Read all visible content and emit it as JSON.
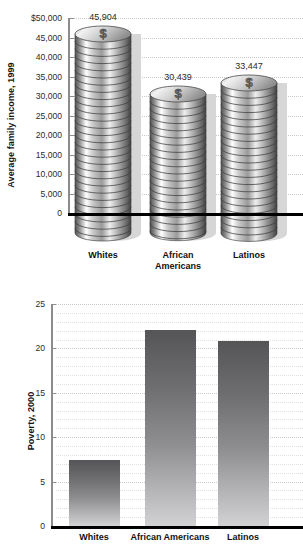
{
  "chart_data": [
    {
      "id": "income-chart",
      "type": "bar",
      "style": "pictorial-coin-stack",
      "title": "",
      "ylabel": "Average family income, 1999",
      "xlabel": "",
      "categories": [
        "Whites",
        "African Americans",
        "Latinos"
      ],
      "category_lines": [
        [
          "Whites"
        ],
        [
          "African",
          "Americans"
        ],
        [
          "Latinos"
        ]
      ],
      "values": [
        45904,
        30439,
        33447
      ],
      "value_labels": [
        "45,904",
        "30,439",
        "33,447"
      ],
      "ylim": [
        0,
        50000
      ],
      "ytick_values": [
        50000,
        45000,
        40000,
        35000,
        30000,
        25000,
        20000,
        15000,
        10000,
        5000,
        0
      ],
      "ytick_labels": [
        "$50,000",
        "45,000",
        "40,000",
        "35,000",
        "30,000",
        "25,000",
        "20,000",
        "15,000",
        "10,000",
        "5,000",
        "0"
      ],
      "grid": true,
      "legend": "none",
      "coin_glyph": "$"
    },
    {
      "id": "poverty-chart",
      "type": "bar",
      "style": "gradient-bars",
      "title": "",
      "ylabel": "Poverty, 2000",
      "xlabel": "",
      "categories": [
        "Whites",
        "African Americans",
        "Latinos"
      ],
      "category_lines": [
        [
          "Whites"
        ],
        [
          "African Americans"
        ],
        [
          "Latinos"
        ]
      ],
      "values": [
        7.4,
        22.1,
        20.8
      ],
      "value_labels": [
        "",
        "",
        ""
      ],
      "ylim": [
        0,
        25
      ],
      "ytick_values": [
        25,
        20,
        15,
        10,
        5,
        0
      ],
      "ytick_labels": [
        "25",
        "20",
        "15",
        "10",
        "5",
        "0"
      ],
      "minor_tick_step": 1,
      "grid": true,
      "legend": "none"
    }
  ],
  "colors": {
    "axis": "#8c8c8c",
    "baseline": "#000000",
    "gridline": "#c9c9c9",
    "bar_top": "#555558",
    "bar_bottom": "#d2d2d4",
    "text": "#1a1a1a"
  }
}
